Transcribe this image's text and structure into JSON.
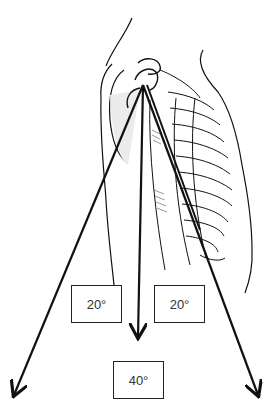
{
  "figure": {
    "labels": [
      {
        "id": "left-angle",
        "text": "20°"
      },
      {
        "id": "right-angle",
        "text": "20°"
      },
      {
        "id": "total-angle",
        "text": "40°"
      }
    ],
    "colors": {
      "line": "#111111",
      "shade": "#e8e8e8",
      "background": "#ffffff"
    }
  }
}
